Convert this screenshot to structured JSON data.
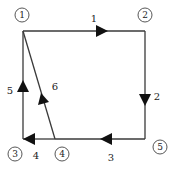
{
  "diagram": {
    "type": "directed-graph",
    "nodes": [
      {
        "id": "1",
        "label": "1",
        "x": 22,
        "y": 15
      },
      {
        "id": "2",
        "label": "2",
        "x": 145,
        "y": 15
      },
      {
        "id": "3",
        "label": "3",
        "x": 15,
        "y": 154
      },
      {
        "id": "4",
        "label": "4",
        "x": 62,
        "y": 154
      },
      {
        "id": "5",
        "label": "5",
        "x": 160,
        "y": 147
      }
    ],
    "edges": [
      {
        "id": "e1",
        "label": "1",
        "from": "1",
        "to": "2",
        "direction": "right"
      },
      {
        "id": "e2",
        "label": "2",
        "from": "2",
        "to": "5",
        "direction": "down"
      },
      {
        "id": "e3",
        "label": "3",
        "from": "5",
        "to": "4",
        "direction": "left"
      },
      {
        "id": "e4",
        "label": "4",
        "from": "4",
        "to": "3",
        "direction": "left"
      },
      {
        "id": "e5",
        "label": "5",
        "from": "3",
        "to": "1",
        "direction": "up"
      },
      {
        "id": "e6",
        "label": "6",
        "from": "4",
        "to": "1",
        "direction": "up-diagonal"
      }
    ],
    "colors": {
      "line": "#3a3a3a",
      "arrow": "#111111",
      "background": "#ffffff"
    }
  }
}
